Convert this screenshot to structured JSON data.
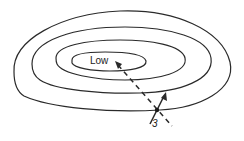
{
  "diagram": {
    "type": "contour-plot",
    "center_label": "Low",
    "step_label": "3",
    "contour_count": 4,
    "colors": {
      "line": "#2a2a2a",
      "background": "#ffffff"
    },
    "elements": {
      "contours": [
        "outer-contour",
        "second-contour",
        "third-contour",
        "inner-contour"
      ],
      "dashed_path": "descent-direction-line",
      "point": "current-point",
      "arrow": "gradient-arrow"
    }
  }
}
